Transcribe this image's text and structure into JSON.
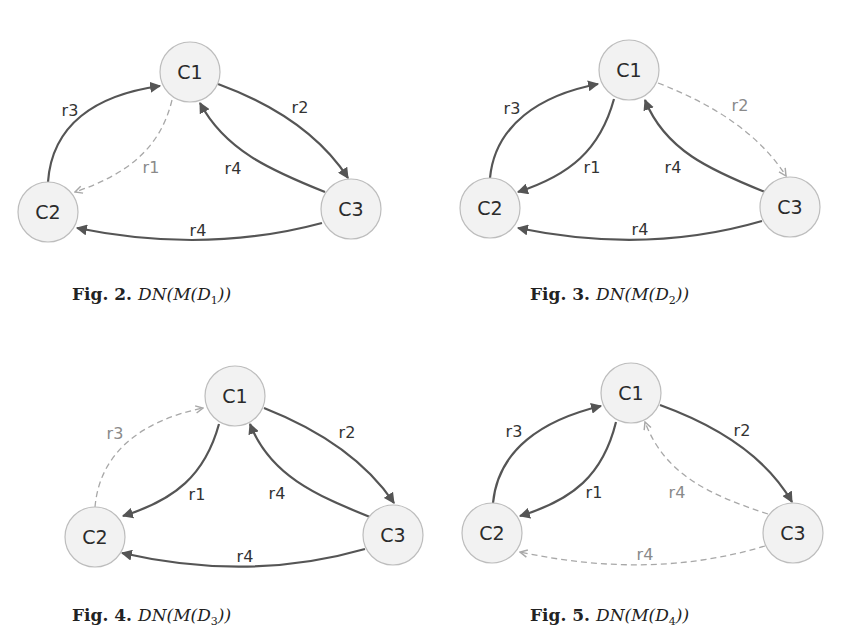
{
  "colors": {
    "node_fill": "#f2f2f2",
    "node_stroke": "#bdbdbd",
    "edge_solid": "#555555",
    "edge_dashed": "#a8a8a8"
  },
  "figures": [
    {
      "id": "fig2",
      "caption": {
        "label": "Fig. 2.",
        "math_prefix": "DN(M(D",
        "subscript": "1",
        "math_suffix": "))",
        "x": 72,
        "y": 284
      },
      "nodes": [
        {
          "id": "C1",
          "label": "C1",
          "x": 190,
          "y": 72,
          "r": 30
        },
        {
          "id": "C2",
          "label": "C2",
          "x": 48,
          "y": 212,
          "r": 30
        },
        {
          "id": "C3",
          "label": "C3",
          "x": 351,
          "y": 209,
          "r": 30
        }
      ],
      "edges": [
        {
          "label": "r3",
          "from": "C2",
          "to": "C1",
          "style": "solid",
          "path": "M48,182 C52,125 95,95 160,86",
          "lx": 70,
          "ly": 110
        },
        {
          "label": "r1",
          "from": "C1",
          "to": "C2",
          "style": "dashed",
          "path": "M172,100 C160,150 125,175 75,192",
          "lx": 151,
          "ly": 167
        },
        {
          "label": "r2",
          "from": "C1",
          "to": "C3",
          "style": "solid",
          "path": "M218,84 C275,105 320,135 348,178",
          "lx": 300,
          "ly": 107
        },
        {
          "label": "r4",
          "from": "C3",
          "to": "C1",
          "style": "solid",
          "path": "M325,192 C270,170 225,150 200,103",
          "lx": 233,
          "ly": 168
        },
        {
          "label": "r4",
          "from": "C3",
          "to": "C2",
          "style": "solid",
          "path": "M322,223 C240,245 160,245 77,228",
          "lx": 198,
          "ly": 230
        }
      ]
    },
    {
      "id": "fig3",
      "caption": {
        "label": "Fig. 3.",
        "math_prefix": "DN(M(D",
        "subscript": "2",
        "math_suffix": "))",
        "x": 530,
        "y": 284
      },
      "nodes": [
        {
          "id": "C1",
          "label": "C1",
          "x": 629,
          "y": 70,
          "r": 30
        },
        {
          "id": "C2",
          "label": "C2",
          "x": 490,
          "y": 208,
          "r": 30
        },
        {
          "id": "C3",
          "label": "C3",
          "x": 790,
          "y": 207,
          "r": 30
        }
      ],
      "edges": [
        {
          "label": "r3",
          "from": "C2",
          "to": "C1",
          "style": "solid",
          "path": "M490,178 C495,125 540,95 598,84",
          "lx": 512,
          "ly": 108
        },
        {
          "label": "r1",
          "from": "C1",
          "to": "C2",
          "style": "solid",
          "path": "M614,99 C600,150 570,175 518,192",
          "lx": 592,
          "ly": 167
        },
        {
          "label": "r2",
          "from": "C1",
          "to": "C3",
          "style": "dashed",
          "path": "M658,83 C715,105 760,135 786,176",
          "lx": 740,
          "ly": 105
        },
        {
          "label": "r4",
          "from": "C3",
          "to": "C1",
          "style": "solid",
          "path": "M765,192 C710,170 665,150 645,100",
          "lx": 673,
          "ly": 167
        },
        {
          "label": "r4",
          "from": "C3",
          "to": "C2",
          "style": "solid",
          "path": "M762,221 C680,245 600,245 518,228",
          "lx": 640,
          "ly": 229
        }
      ]
    },
    {
      "id": "fig4",
      "caption": {
        "label": "Fig. 4.",
        "math_prefix": "DN(M(D",
        "subscript": "3",
        "math_suffix": "))",
        "x": 72,
        "y": 605
      },
      "nodes": [
        {
          "id": "C1",
          "label": "C1",
          "x": 235,
          "y": 396,
          "r": 30
        },
        {
          "id": "C2",
          "label": "C2",
          "x": 95,
          "y": 537,
          "r": 30
        },
        {
          "id": "C3",
          "label": "C3",
          "x": 393,
          "y": 535,
          "r": 30
        }
      ],
      "edges": [
        {
          "label": "r3",
          "from": "C2",
          "to": "C1",
          "style": "dashed",
          "path": "M95,507 C100,450 145,420 203,408",
          "lx": 115,
          "ly": 433
        },
        {
          "label": "r1",
          "from": "C1",
          "to": "C2",
          "style": "solid",
          "path": "M219,424 C205,475 175,500 123,516",
          "lx": 197,
          "ly": 494
        },
        {
          "label": "r2",
          "from": "C1",
          "to": "C3",
          "style": "solid",
          "path": "M264,408 C320,430 365,460 394,503",
          "lx": 347,
          "ly": 432
        },
        {
          "label": "r4",
          "from": "C3",
          "to": "C1",
          "style": "solid",
          "path": "M370,517 C315,495 270,475 250,424",
          "lx": 277,
          "ly": 493
        },
        {
          "label": "r4",
          "from": "C3",
          "to": "C2",
          "style": "solid",
          "path": "M365,549 C285,572 205,572 122,553",
          "lx": 245,
          "ly": 556
        }
      ]
    },
    {
      "id": "fig5",
      "caption": {
        "label": "Fig. 5.",
        "math_prefix": "DN(M(D",
        "subscript": "4",
        "math_suffix": "))",
        "x": 530,
        "y": 605
      },
      "nodes": [
        {
          "id": "C1",
          "label": "C1",
          "x": 631,
          "y": 393,
          "r": 30
        },
        {
          "id": "C2",
          "label": "C2",
          "x": 492,
          "y": 533,
          "r": 30
        },
        {
          "id": "C3",
          "label": "C3",
          "x": 793,
          "y": 533,
          "r": 30
        }
      ],
      "edges": [
        {
          "label": "r3",
          "from": "C2",
          "to": "C1",
          "style": "solid",
          "path": "M493,503 C498,450 542,420 601,406",
          "lx": 514,
          "ly": 431
        },
        {
          "label": "r1",
          "from": "C1",
          "to": "C2",
          "style": "solid",
          "path": "M616,422 C603,475 573,500 520,516",
          "lx": 594,
          "ly": 492
        },
        {
          "label": "r2",
          "from": "C1",
          "to": "C3",
          "style": "solid",
          "path": "M660,405 C715,425 765,455 792,502",
          "lx": 742,
          "ly": 430
        },
        {
          "label": "r4",
          "from": "C3",
          "to": "C1",
          "style": "dashed",
          "path": "M768,514 C710,495 665,475 645,422",
          "lx": 677,
          "ly": 492
        },
        {
          "label": "r4",
          "from": "C3",
          "to": "C2",
          "style": "dashed",
          "path": "M765,546 C685,570 605,570 520,552",
          "lx": 645,
          "ly": 554
        }
      ]
    }
  ]
}
